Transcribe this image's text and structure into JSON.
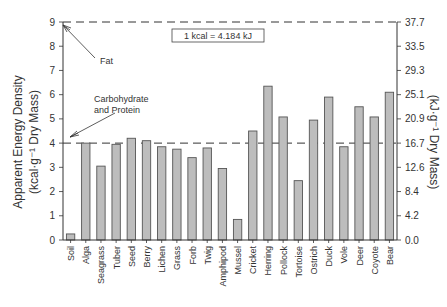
{
  "chart_data": {
    "type": "bar",
    "title": "",
    "xlabel": "",
    "ylabel": "Apparent Energy Density",
    "ylabel_units": "(kcal·g⁻¹ Dry Mass)",
    "ylabel_right": "(kJ·g⁻¹ Dry Mass)",
    "ylim": [
      0,
      9
    ],
    "yticks": [
      0,
      1,
      2,
      3,
      4,
      5,
      6,
      7,
      8,
      9
    ],
    "yticks_right": [
      "0.0",
      "4.2",
      "8.4",
      "12.6",
      "16.7",
      "20.9",
      "25.1",
      "29.3",
      "33.5",
      "37.7"
    ],
    "categories": [
      "Soil",
      "Alga",
      "Seagrass",
      "Tuber",
      "Seed",
      "Berry",
      "Lichen",
      "Grass",
      "Forb",
      "Twig",
      "Amphipod",
      "Mussel",
      "Cricket",
      "Herring",
      "Pollock",
      "Tortoise",
      "Ostrich",
      "Duck",
      "Vole",
      "Deer",
      "Coyote",
      "Bear"
    ],
    "values": [
      0.25,
      4.0,
      3.05,
      3.95,
      4.2,
      4.1,
      3.85,
      3.75,
      3.4,
      3.8,
      2.95,
      0.85,
      4.5,
      6.35,
      5.08,
      2.45,
      4.95,
      5.9,
      3.85,
      5.5,
      5.08,
      6.1
    ],
    "reference_lines": [
      {
        "label": "Fat",
        "value": 9
      },
      {
        "label": "Carbohydrate and Protein",
        "value": 4
      }
    ],
    "annotations": [
      "1 kcal = 4.184 kJ",
      "Fat",
      "Carbohydrate",
      "and Protein"
    ],
    "grid": false,
    "legend": null,
    "bar_color": "#bdbdbd",
    "bar_edge_color": "#555555"
  }
}
